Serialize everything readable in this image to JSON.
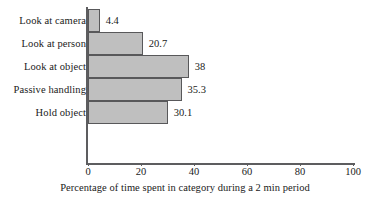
{
  "chart_data": {
    "type": "bar",
    "orientation": "horizontal",
    "title": "",
    "xlabel": "Percentage of time spent in category during a 2 min period",
    "ylabel": "",
    "categories": [
      "Look at camera",
      "Look at person",
      "Look at object",
      "Passive handling",
      "Hold object"
    ],
    "values": [
      4.4,
      20.7,
      38,
      35.3,
      30.1
    ],
    "value_labels": [
      "4.4",
      "20.7",
      "38",
      "35.3",
      "30.1"
    ],
    "xlim": [
      0,
      100
    ],
    "xticks": [
      0,
      20,
      40,
      60,
      80,
      100
    ],
    "xtick_labels": [
      "0",
      "20",
      "40",
      "60",
      "80",
      "100"
    ],
    "grid": false,
    "legend": false,
    "bar_fill_color": "#bfbfbf",
    "bar_edge_color": "#58585a",
    "axis_color": "#5d5d5f",
    "background_color": "#ffffff"
  }
}
